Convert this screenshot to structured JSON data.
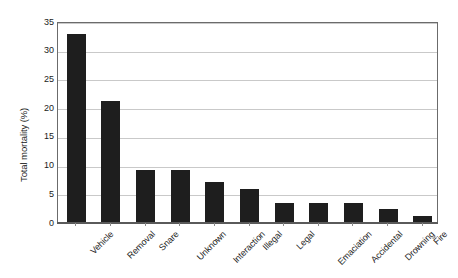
{
  "chart_data": {
    "type": "bar",
    "title": "",
    "xlabel": "",
    "ylabel": "Total mortality (%)",
    "ylim": [
      0,
      35
    ],
    "yticks": [
      0,
      5,
      10,
      15,
      20,
      25,
      30,
      35
    ],
    "ytick_labels": [
      "0",
      "5",
      "10",
      "15",
      "20",
      "25",
      "30",
      "35"
    ],
    "grid": true,
    "legend": "none",
    "bar_color": "#1e1e1e",
    "categories": [
      "Vehicle",
      "Removal",
      "Snare",
      "Unknown",
      "Interaction",
      "Illegal",
      "Legal",
      "Emaciation",
      "Accidental",
      "Drowning",
      "Fire"
    ],
    "values": [
      32.8,
      21.0,
      9.1,
      9.1,
      6.9,
      5.8,
      3.3,
      3.3,
      3.3,
      2.2,
      1.1
    ]
  }
}
